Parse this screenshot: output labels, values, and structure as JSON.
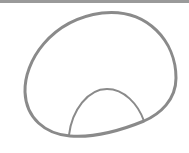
{
  "canvas": {
    "width": 189,
    "height": 153,
    "background": "#ffffff"
  },
  "top_bar": {
    "color": "#9a9a9a",
    "height": 3
  },
  "shapes": {
    "outer_loop": {
      "type": "closed-curve",
      "stroke": "#8a8a8a",
      "stroke_width": 3
    },
    "inner_arch": {
      "type": "arch",
      "stroke": "#8a8a8a",
      "stroke_width": 2
    }
  }
}
